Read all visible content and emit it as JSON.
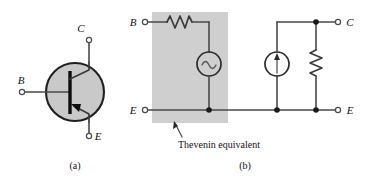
{
  "figure": {
    "panels": [
      {
        "id": "a",
        "caption": "(a)",
        "kind": "transistor-symbol",
        "device_type": "npn bipolar junction transistor",
        "terminals": [
          {
            "name": "B",
            "label": "B",
            "position": "left"
          },
          {
            "name": "C",
            "label": "C",
            "position": "top"
          },
          {
            "name": "E",
            "label": "E",
            "position": "bottom"
          }
        ]
      },
      {
        "id": "b",
        "caption": "(b)",
        "kind": "equivalent-circuit",
        "terminals": [
          {
            "name": "B",
            "label": "B",
            "position": "top-left"
          },
          {
            "name": "E-left",
            "label": "E",
            "position": "bottom-left"
          },
          {
            "name": "C",
            "label": "C",
            "position": "top-right"
          },
          {
            "name": "E-right",
            "label": "E",
            "position": "bottom-right"
          }
        ],
        "annotation": {
          "text": "Thevenin equivalent",
          "points_to": "shaded-region"
        },
        "components": [
          {
            "name": "series-resistor",
            "symbol": "zigzag-resistor",
            "branch": "base"
          },
          {
            "name": "ac-voltage-source",
            "symbol": "sine-circle",
            "branch": "base"
          },
          {
            "name": "current-source",
            "symbol": "arrow-circle",
            "branch": "collector"
          },
          {
            "name": "shunt-resistor",
            "symbol": "zigzag-resistor",
            "branch": "collector"
          }
        ]
      }
    ],
    "colors": {
      "shade": "#cfcfcf",
      "body_fill": "#c9c9c9",
      "wire": "#4a4a4a",
      "outline": "#1f1f1f",
      "text": "#101010",
      "background": "#ffffff"
    }
  }
}
